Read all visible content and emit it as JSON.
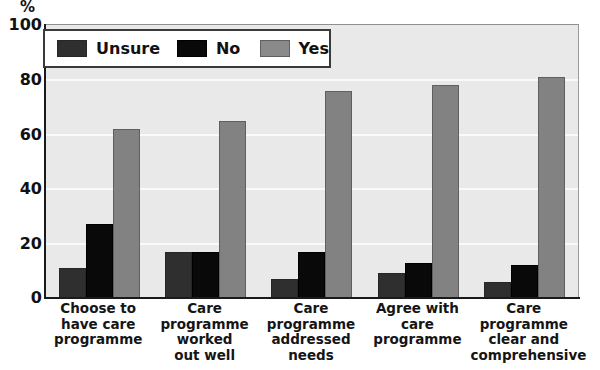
{
  "chart_data": {
    "type": "bar",
    "title": "",
    "subtitle": "",
    "xlabel": "",
    "ylabel": "%",
    "ylim": [
      0,
      100
    ],
    "yticks": [
      0,
      20,
      40,
      60,
      80,
      100
    ],
    "grid": true,
    "legend_position": "top-left",
    "categories": [
      "Choose to\nhave care\nprogramme",
      "Care\nprogramme\nworked\nout well",
      "Care\nprogramme\naddressed\nneeds",
      "Agree with\ncare\nprogramme",
      "Care\nprogramme\nclear and\ncomprehensive"
    ],
    "series": [
      {
        "name": "Unsure",
        "color": "#2f2f2f",
        "values": [
          11,
          17,
          7,
          9,
          6
        ]
      },
      {
        "name": "No",
        "color": "#090909",
        "values": [
          27,
          17,
          17,
          13,
          12
        ]
      },
      {
        "name": "Yes",
        "color": "#828282",
        "values": [
          62,
          65,
          76,
          78,
          81
        ]
      }
    ]
  },
  "axis": {
    "unit": "%",
    "tick_0": "0",
    "tick_20": "20",
    "tick_40": "40",
    "tick_60": "60",
    "tick_80": "80",
    "tick_100": "100"
  },
  "legend": {
    "items": [
      {
        "label": "Unsure"
      },
      {
        "label": "No"
      },
      {
        "label": "Yes"
      }
    ]
  },
  "colors": {
    "plot_background": "#e9e9e9",
    "gridline": "#fafafa",
    "axis": "#1a1a1a",
    "unsure": "#2f2f2f",
    "no": "#090909",
    "yes": "#828282"
  }
}
